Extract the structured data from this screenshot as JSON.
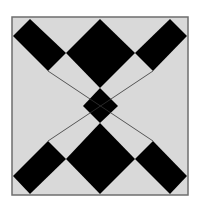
{
  "diagram": {
    "title": "",
    "colors": {
      "background": "#ffffff",
      "field": "#d9d9d9",
      "frame": "#6e6e6e",
      "dark": "#000000",
      "line": "#333333"
    },
    "frame": {
      "x": 12,
      "y": 17,
      "w": 176,
      "h": 178
    },
    "shapes": [
      {
        "name": "top-diamond",
        "points": "100,19 135,53 100,88 66,53"
      },
      {
        "name": "bottom-diamond",
        "points": "100,123 135,159 100,194 66,159"
      },
      {
        "name": "center-diamond",
        "points": "100,88 118,106 100,123 83,106"
      },
      {
        "name": "top-left-bar",
        "points": "30,19 13,36 48,71 66,53"
      },
      {
        "name": "top-right-bar",
        "points": "170,19 135,53 153,71 187,36"
      },
      {
        "name": "bottom-left-bar",
        "points": "48,141 13,176 30,194 66,159"
      },
      {
        "name": "bottom-right-bar",
        "points": "153,141 135,159 170,194 187,176"
      }
    ],
    "lines": [
      {
        "name": "diagonal-tl-br",
        "x1": 48,
        "y1": 71,
        "x2": 153,
        "y2": 141
      },
      {
        "name": "diagonal-tr-bl",
        "x1": 153,
        "y1": 71,
        "x2": 48,
        "y2": 141
      }
    ]
  }
}
